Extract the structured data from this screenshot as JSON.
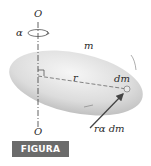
{
  "figure": {
    "caption": "FIGURA B/1",
    "caption_bg": "#6b6b6b",
    "caption_fg": "#ffffff"
  },
  "labels": {
    "axis_top": "O",
    "axis_bottom": "O",
    "angular_acceleration": "α",
    "mass": "m",
    "radius": "r",
    "mass_element": "dm",
    "tangential_force": "rα dm"
  },
  "colors": {
    "body_fill_light": "#f2f2f2",
    "body_fill_dark": "#bdbdbd",
    "line": "#3a3a3a",
    "arrow": "#4a4a4a"
  }
}
